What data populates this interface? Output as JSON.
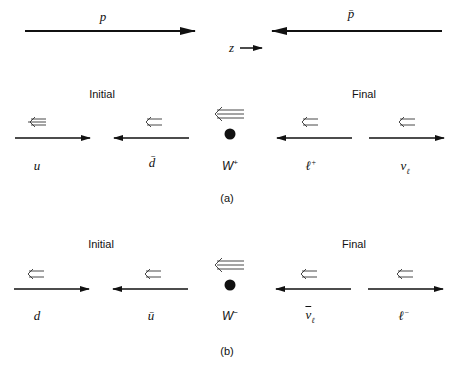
{
  "top": {
    "proton_label": "p",
    "antiproton_label": "p̄",
    "z_label": "z"
  },
  "panel_a": {
    "initial_title": "Initial",
    "final_title": "Final",
    "particles": [
      "u",
      "d̄",
      "W",
      "ℓ",
      "ν"
    ],
    "w_label": "W",
    "w_charge": "+",
    "lepton_label": "ℓ",
    "lepton_charge": "+",
    "neutrino_label": "ν",
    "neutrino_sub": "ℓ",
    "caption": "(a)"
  },
  "panel_b": {
    "initial_title": "Initial",
    "final_title": "Final",
    "quark_label": "d",
    "antiquark_label": "ū",
    "w_label": "W",
    "w_charge": "−",
    "antineutrino_label": "ν",
    "antineutrino_sub": "ℓ",
    "lepton_label": "ℓ",
    "lepton_charge": "−",
    "caption": "(b)"
  },
  "spin_arrow_glyph": "⇐"
}
